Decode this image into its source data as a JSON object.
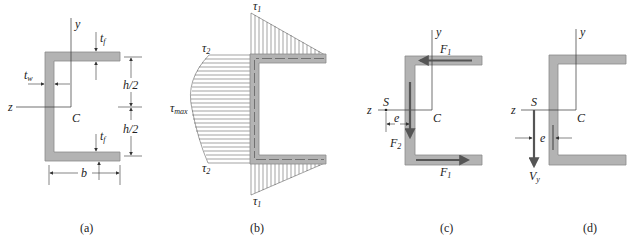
{
  "figure": {
    "panels": [
      {
        "id": "a",
        "caption": "(a)",
        "labels": {
          "y_axis": "y",
          "z_axis": "z",
          "centroid": "C",
          "flange_thickness": "t",
          "flange_thickness_sub": "f",
          "web_thickness": "t",
          "web_thickness_sub": "w",
          "half_height": "h/2",
          "width": "b"
        }
      },
      {
        "id": "b",
        "caption": "(b)",
        "labels": {
          "tau1_top": "τ",
          "tau1_top_sub": "1",
          "tau2_top": "τ",
          "tau2_top_sub": "2",
          "tau_max": "τ",
          "tau_max_sub": "max",
          "tau2_bottom": "τ",
          "tau2_bottom_sub": "2",
          "tau1_bottom": "τ",
          "tau1_bottom_sub": "1"
        }
      },
      {
        "id": "c",
        "caption": "(c)",
        "labels": {
          "y_axis": "y",
          "z_axis": "z",
          "shear_center": "S",
          "centroid": "C",
          "eccentricity": "e",
          "force_top": "F",
          "force_top_sub": "1",
          "force_web": "F",
          "force_web_sub": "2",
          "force_bottom": "F",
          "force_bottom_sub": "1"
        }
      },
      {
        "id": "d",
        "caption": "(d)",
        "labels": {
          "y_axis": "y",
          "z_axis": "z",
          "shear_center": "S",
          "centroid": "C",
          "eccentricity": "e",
          "shear_force": "V",
          "shear_force_sub": "y"
        }
      }
    ],
    "colors": {
      "section_fill": "#b3b3b3",
      "section_stroke": "#8a8a8a",
      "arrow": "#555555",
      "line": "#333333"
    }
  }
}
